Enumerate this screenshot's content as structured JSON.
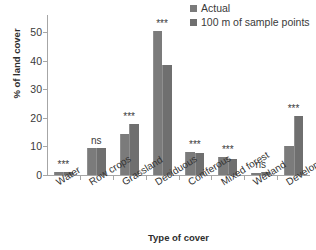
{
  "chart_data": {
    "type": "bar",
    "title": "",
    "xlabel": "Type of cover",
    "ylabel": "% of land cover",
    "ylim": [
      0,
      55
    ],
    "yticks": [
      0,
      10,
      20,
      30,
      40,
      50
    ],
    "grid": false,
    "legend_position": "top-right",
    "categories": [
      "Water",
      "Row crops",
      "Grassland",
      "Deciduous",
      "Coniferous",
      "Mixed forest",
      "Wetland",
      "Developed"
    ],
    "series": [
      {
        "name": "Actual",
        "color": "#7b7b7b",
        "values": [
          1.2,
          9.3,
          14.2,
          50.5,
          8.0,
          6.2,
          0.7,
          10.3
        ]
      },
      {
        "name": "100 m of sample points",
        "color": "#6f6f6f",
        "values": [
          0.9,
          9.6,
          17.8,
          38.5,
          7.6,
          5.6,
          0.9,
          20.8
        ]
      }
    ],
    "annotations": [
      "***",
      "ns",
      "***",
      "***",
      "***",
      "***",
      "ns",
      "***"
    ]
  },
  "legend": {
    "items": [
      {
        "label": "Actual",
        "swatch": "#7b7b7b"
      },
      {
        "label": "100 m of sample points",
        "swatch": "#6f6f6f"
      }
    ]
  },
  "axes": {
    "y_title": "% of land cover",
    "x_title": "Type of cover",
    "y_tick_labels": [
      "50",
      "40",
      "30",
      "20",
      "10",
      "0"
    ]
  }
}
